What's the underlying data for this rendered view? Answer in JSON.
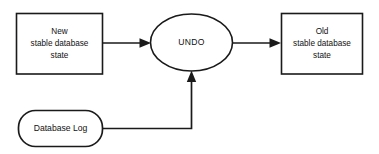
{
  "diagram": {
    "type": "flowchart",
    "background_color": "#ffffff",
    "line_color": "#1a1a1a",
    "text_color": "#111111",
    "nodes": [
      {
        "id": "new-state",
        "shape": "rectangle",
        "lines": [
          "New",
          "stable database",
          "state"
        ],
        "line1": "New",
        "line2": "stable database",
        "line3": "state"
      },
      {
        "id": "undo",
        "shape": "ellipse",
        "label": "UNDO"
      },
      {
        "id": "old-state",
        "shape": "rectangle",
        "lines": [
          "Old",
          "stable database",
          "state"
        ],
        "line1": "Old",
        "line2": "stable database",
        "line3": "state"
      },
      {
        "id": "database-log",
        "shape": "rounded-rectangle",
        "label": "Database Log"
      }
    ],
    "edges": [
      {
        "id": "edge-new-to-undo",
        "from": "new-state",
        "to": "undo",
        "label": "",
        "arrow": "to"
      },
      {
        "id": "edge-undo-to-old",
        "from": "undo",
        "to": "old-state",
        "label": "",
        "arrow": "to"
      },
      {
        "id": "edge-log-to-undo",
        "from": "database-log",
        "to": "undo",
        "label": "",
        "arrow": "to"
      }
    ]
  }
}
